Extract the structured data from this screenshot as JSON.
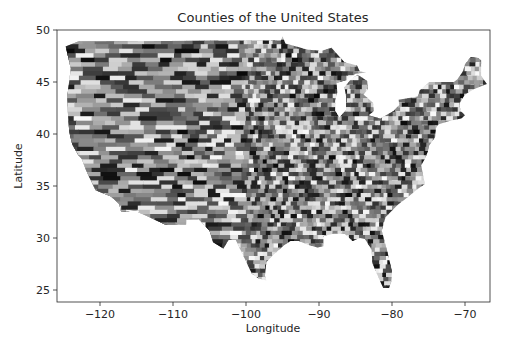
{
  "chart_data": {
    "type": "heatmap",
    "subtype": "choropleth-map",
    "title": "Counties of the United States",
    "xlabel": "Longitude",
    "ylabel": "Latitude",
    "xlim": [
      -126,
      -66.5
    ],
    "ylim": [
      24,
      50
    ],
    "xticks": [
      -120,
      -110,
      -100,
      -90,
      -80,
      -70
    ],
    "xtick_labels": [
      "−120",
      "−110",
      "−100",
      "−90",
      "−80",
      "−70"
    ],
    "yticks": [
      25,
      30,
      35,
      40,
      45,
      50
    ],
    "ytick_labels": [
      "25",
      "30",
      "35",
      "40",
      "45",
      "50"
    ],
    "grid": false,
    "legend": null,
    "colormap": "grayscale (random per county)"
  },
  "colors": {
    "background": "#ffffff",
    "axis": "#262626",
    "text": "#262626"
  }
}
